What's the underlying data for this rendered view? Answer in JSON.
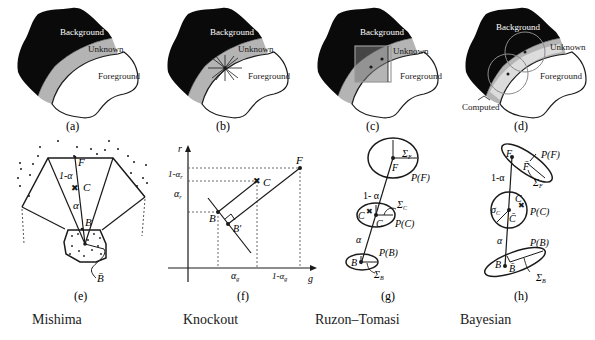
{
  "panels_top": [
    {
      "id": "a",
      "caption": "(a)",
      "labels": {
        "background": "Background",
        "unknown": "Unknown",
        "foreground": "Foreground"
      }
    },
    {
      "id": "b",
      "caption": "(b)",
      "labels": {
        "background": "Background",
        "unknown": "Unknown",
        "foreground": "Foreground"
      }
    },
    {
      "id": "c",
      "caption": "(c)",
      "labels": {
        "background": "Background",
        "unknown": "Unknown",
        "foreground": "Foreground"
      }
    },
    {
      "id": "d",
      "caption": "(d)",
      "labels": {
        "background": "Background",
        "unknown": "Unknown",
        "foreground": "Foreground",
        "computed": "Computed"
      }
    }
  ],
  "panels_bottom": [
    {
      "id": "e",
      "caption": "(e)",
      "labels": {
        "F": "F",
        "C": "C",
        "B": "B",
        "Bbar": "B̄",
        "one_minus_alpha": "1-α",
        "alpha": "α"
      }
    },
    {
      "id": "f",
      "caption": "(f)",
      "labels": {
        "r": "r",
        "g": "g",
        "F": "F",
        "C": "C",
        "B": "B",
        "Bprime": "B'",
        "one_minus_alpha_r": "1-α",
        "alpha_r": "α",
        "alpha_g": "α",
        "one_minus_alpha_g": "1-α",
        "sub_r": "r",
        "sub_g": "g"
      }
    },
    {
      "id": "g",
      "caption": "(g)",
      "labels": {
        "sigmaF": "Σ",
        "sigmaF_sub": "F",
        "F": "F",
        "PF": "P(F)",
        "one_minus_alpha": "1- α",
        "sigmaC": "Σ",
        "sigmaC_sub": "C",
        "C": "C",
        "Cbar": "C",
        "PC": "P(C)",
        "alpha": "α",
        "PB": "P(B)",
        "B": "B",
        "sigmaB": "Σ",
        "sigmaB_sub": "B"
      }
    },
    {
      "id": "h",
      "caption": "(h)",
      "labels": {
        "F": "F",
        "Fbar": "F̄",
        "PF": "P(F)",
        "sigmaF": "Σ",
        "sigmaF_sub": "F",
        "one_minus_alpha": "1-α",
        "C": "C",
        "sigmaC": "σ",
        "sigmaC_sub": "C",
        "Cbar": "C̄",
        "PC": "P(C)",
        "alpha": "α",
        "PB": "P(B)",
        "B": "B",
        "Bbar": "B̄",
        "sigmaB": "Σ",
        "sigmaB_sub": "B"
      }
    }
  ],
  "methods": [
    "Mishima",
    "Knockout",
    "Ruzon–Tomasi",
    "Bayesian"
  ],
  "colors": {
    "background_region": "#0a0a0a",
    "unknown_region": "#b4b4b4",
    "foreground_region": "#ffffff",
    "stroke": "#1a1a1a",
    "dashed": "#444444"
  }
}
